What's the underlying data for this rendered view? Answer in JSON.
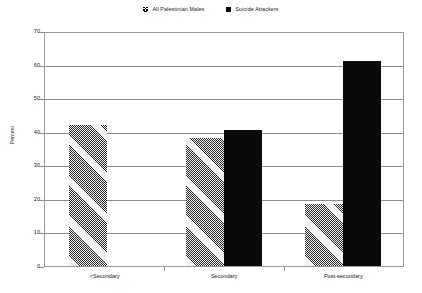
{
  "chart_data": {
    "type": "bar",
    "title": "",
    "subtitle": "",
    "xlabel": "",
    "ylabel": "Percent",
    "ylim": [
      0,
      70
    ],
    "ytick_step": 10,
    "yticks": [
      "0",
      "10",
      "20",
      "30",
      "40",
      "50",
      "60",
      "70"
    ],
    "grid": true,
    "legend_position": "top-center",
    "categories": [
      "<Secondary",
      "Secondary",
      "Post-secondary"
    ],
    "series": [
      {
        "name": "All Palestinian Males",
        "style": "hatched",
        "color": "#ffffff",
        "values": [
          42,
          38,
          18.5
        ]
      },
      {
        "name": "Suicide Attackers",
        "style": "solid",
        "color": "#0a0a0a",
        "values": [
          null,
          40.5,
          61
        ]
      }
    ]
  },
  "legend": {
    "items": [
      {
        "label": "All Palestinian Males",
        "swatch": "hatched-square-icon"
      },
      {
        "label": "Suicide Attackers",
        "swatch": "black-square-icon"
      }
    ]
  },
  "axes": {
    "y_title": "Percent",
    "y_tick_labels": [
      "70",
      "60",
      "50",
      "40",
      "30",
      "20",
      "10",
      "0"
    ],
    "x_tick_labels": [
      "<Secondary",
      "Secondary",
      "Post-secondary"
    ]
  },
  "colors": {
    "axis_line": "#8d8d8d",
    "frame": "#9a9a9a",
    "series_solid": "#0a0a0a",
    "background": "#ffffff",
    "text": "#1a1a1a"
  }
}
